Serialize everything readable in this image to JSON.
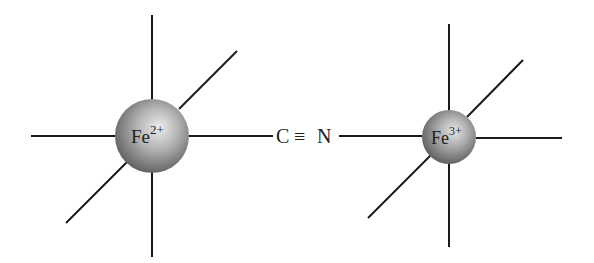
{
  "diagram": {
    "type": "coordination-bridge",
    "left_ion": {
      "symbol": "Fe",
      "charge": "2+",
      "center": [
        152,
        136
      ],
      "radius": 37
    },
    "bridge": {
      "carbon": "C",
      "bond": "≡",
      "nitrogen": "N"
    },
    "right_ion": {
      "symbol": "Fe",
      "charge": "3+",
      "center": [
        449,
        137
      ],
      "radius": 27
    },
    "colors": {
      "bond": "#1a1a1a",
      "sphere_highlight": "#e6e6e6",
      "sphere_mid": "#9a9a9a",
      "sphere_shadow": "#5a5a5a",
      "text": "#222222",
      "background": "#ffffff"
    }
  }
}
